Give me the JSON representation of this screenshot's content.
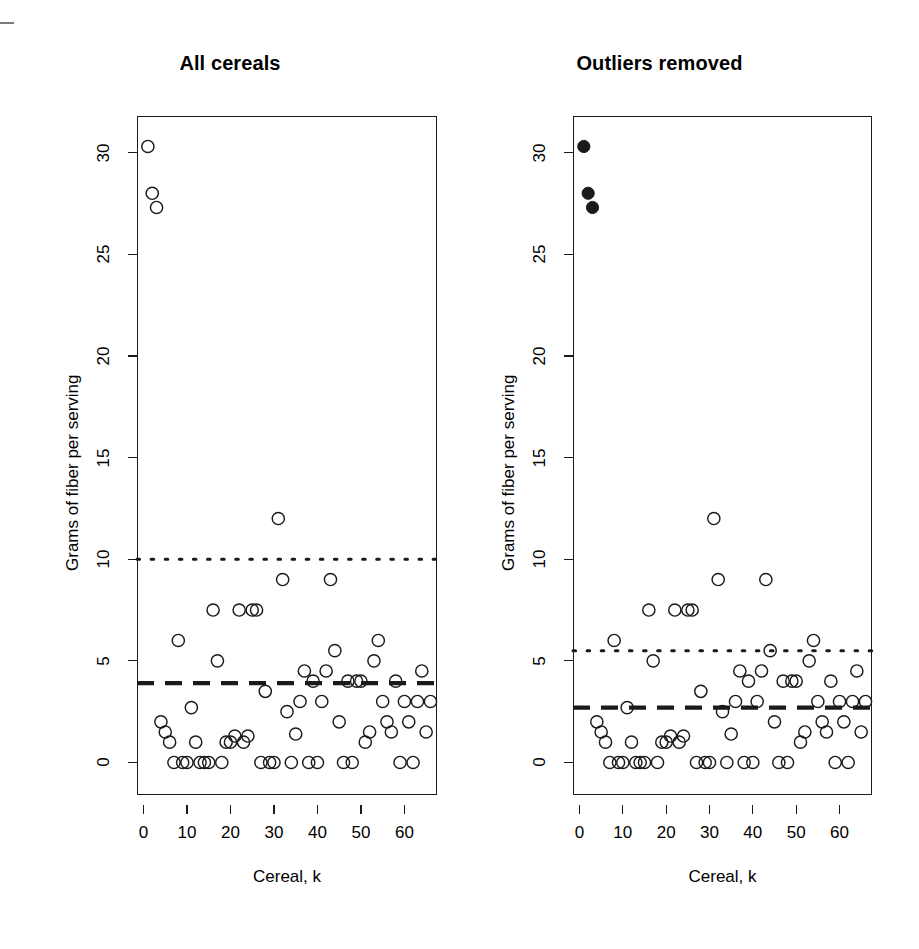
{
  "figure": {
    "background": "#ffffff",
    "ink": "#1a1a1a",
    "edge_mark": "page-scan-edge-artifact"
  },
  "panels": [
    {
      "id": "all-cereals",
      "title": "All cereals",
      "xlabel": "Cereal,  k",
      "ylabel": "Grams of fiber per serving",
      "point_style": "open-circle"
    },
    {
      "id": "outliers-removed",
      "title": "Outliers removed",
      "xlabel": "Cereal,  k",
      "ylabel": "Grams of fiber per serving",
      "point_style": "open-circle-with-filled-outliers"
    }
  ],
  "axes": {
    "y_ticks": [
      0,
      5,
      10,
      15,
      20,
      25,
      30
    ],
    "x_ticks": [
      0,
      10,
      20,
      30,
      40,
      50,
      60
    ],
    "ylim": [
      -1.6,
      31.8
    ],
    "xlim": [
      -1.5,
      67.5
    ]
  },
  "chart_data": [
    {
      "type": "scatter",
      "title": "All cereals",
      "xlabel": "Cereal,  k",
      "ylabel": "Grams of fiber per serving",
      "xlim": [
        -1.5,
        67.5
      ],
      "ylim": [
        -1.6,
        31.8
      ],
      "xticks": [
        0,
        10,
        20,
        30,
        40,
        50,
        60
      ],
      "yticks": [
        0,
        5,
        10,
        15,
        20,
        25,
        30
      ],
      "grid": false,
      "legend": "none",
      "marker": "open circle",
      "annotations": [
        {
          "kind": "horizontal-dotted-line",
          "y": 10.0,
          "label": "upper outlier threshold"
        },
        {
          "kind": "horizontal-dashed-line",
          "y": 3.9,
          "label": "mean fiber"
        }
      ],
      "x": [
        1,
        2,
        3,
        4,
        5,
        6,
        7,
        8,
        9,
        10,
        11,
        12,
        13,
        14,
        15,
        16,
        17,
        18,
        19,
        20,
        21,
        22,
        23,
        24,
        25,
        26,
        27,
        28,
        29,
        30,
        31,
        32,
        33,
        34,
        35,
        36,
        37,
        38,
        39,
        40,
        41,
        42,
        43,
        44,
        45,
        46,
        47,
        48,
        49,
        50,
        51,
        52,
        53,
        54,
        55,
        56,
        57,
        58,
        59,
        60,
        61,
        62,
        63,
        64,
        65,
        66
      ],
      "y": [
        30.3,
        28.0,
        27.3,
        2.0,
        1.5,
        1.0,
        0.0,
        6.0,
        0.0,
        0.0,
        2.7,
        1.0,
        0.0,
        0.0,
        0.0,
        7.5,
        5.0,
        0.0,
        1.0,
        1.0,
        1.3,
        7.5,
        1.0,
        1.3,
        7.5,
        7.5,
        0.0,
        3.5,
        0.0,
        0.0,
        12.0,
        9.0,
        2.5,
        0.0,
        1.4,
        3.0,
        4.5,
        0.0,
        4.0,
        0.0,
        3.0,
        4.5,
        9.0,
        5.5,
        2.0,
        0.0,
        4.0,
        0.0,
        4.0,
        4.0,
        1.0,
        1.5,
        5.0,
        6.0,
        3.0,
        2.0,
        1.5,
        4.0,
        0.0,
        3.0,
        2.0,
        0.0,
        3.0,
        4.5,
        1.5,
        3.0
      ]
    },
    {
      "type": "scatter",
      "title": "Outliers removed",
      "xlabel": "Cereal,  k",
      "ylabel": "Grams of fiber per serving",
      "xlim": [
        -1.5,
        67.5
      ],
      "ylim": [
        -1.6,
        31.8
      ],
      "xticks": [
        0,
        10,
        20,
        30,
        40,
        50,
        60
      ],
      "yticks": [
        0,
        5,
        10,
        15,
        20,
        25,
        30
      ],
      "grid": false,
      "legend": "none",
      "marker": "open circle; filled circle for excluded outliers",
      "annotations": [
        {
          "kind": "horizontal-dotted-line",
          "y": 5.5,
          "label": "upper outlier threshold recomputed"
        },
        {
          "kind": "horizontal-dashed-line",
          "y": 2.7,
          "label": "mean fiber recomputed"
        }
      ],
      "excluded_outliers": [
        {
          "x": 1,
          "y": 30.3
        },
        {
          "x": 2,
          "y": 28.0
        },
        {
          "x": 3,
          "y": 27.3
        }
      ],
      "x": [
        1,
        2,
        3,
        4,
        5,
        6,
        7,
        8,
        9,
        10,
        11,
        12,
        13,
        14,
        15,
        16,
        17,
        18,
        19,
        20,
        21,
        22,
        23,
        24,
        25,
        26,
        27,
        28,
        29,
        30,
        31,
        32,
        33,
        34,
        35,
        36,
        37,
        38,
        39,
        40,
        41,
        42,
        43,
        44,
        45,
        46,
        47,
        48,
        49,
        50,
        51,
        52,
        53,
        54,
        55,
        56,
        57,
        58,
        59,
        60,
        61,
        62,
        63,
        64,
        65,
        66
      ],
      "y": [
        30.3,
        28.0,
        27.3,
        2.0,
        1.5,
        1.0,
        0.0,
        6.0,
        0.0,
        0.0,
        2.7,
        1.0,
        0.0,
        0.0,
        0.0,
        7.5,
        5.0,
        0.0,
        1.0,
        1.0,
        1.3,
        7.5,
        1.0,
        1.3,
        7.5,
        7.5,
        0.0,
        3.5,
        0.0,
        0.0,
        12.0,
        9.0,
        2.5,
        0.0,
        1.4,
        3.0,
        4.5,
        0.0,
        4.0,
        0.0,
        3.0,
        4.5,
        9.0,
        5.5,
        2.0,
        0.0,
        4.0,
        0.0,
        4.0,
        4.0,
        1.0,
        1.5,
        5.0,
        6.0,
        3.0,
        2.0,
        1.5,
        4.0,
        0.0,
        3.0,
        2.0,
        0.0,
        3.0,
        4.5,
        1.5,
        3.0
      ]
    }
  ]
}
